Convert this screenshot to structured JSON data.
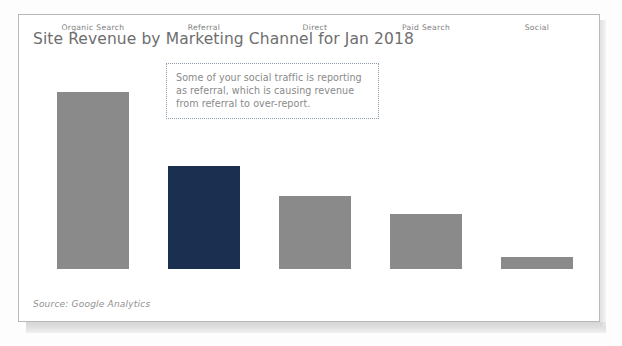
{
  "figure": {
    "title": "Site Revenue by Marketing Channel for Jan 2018",
    "source_note": "Source: Google Analytics",
    "annotation": "Some of your social traffic is reporting\nas referral, which is causing revenue\nfrom referral to over-report.",
    "colors": {
      "bar_default": "#8a8a8a",
      "bar_highlight": "#1b3050",
      "title_text": "#6e6e6e",
      "label_text": "#7d7d7d",
      "annotation_text": "#8a8a8a",
      "annotation_border": "#8d9aab",
      "frame_border": "#b9b9b9",
      "background": "#ffffff"
    }
  },
  "chart_data": {
    "type": "bar",
    "title": "Site Revenue by Marketing Channel for Jan 2018",
    "xlabel": "",
    "ylabel": "",
    "categories": [
      "Organic Search",
      "Referral",
      "Direct",
      "Paid Search",
      "Social"
    ],
    "values": [
      100,
      58,
      41,
      31,
      7
    ],
    "ylim": [
      0,
      100
    ],
    "grid": false,
    "legend": null,
    "bar_colors": [
      "#8a8a8a",
      "#1b3050",
      "#8a8a8a",
      "#8a8a8a",
      "#8a8a8a"
    ],
    "highlight_category": "Referral",
    "annotations": [
      {
        "text": "Some of your social traffic is reporting as referral, which is causing revenue from referral to over-report.",
        "style": "dotted-box"
      }
    ],
    "source": "Source: Google Analytics",
    "note": "Values are relative revenue indexed so the tallest bar (Organic Search) = 100; axis is unlabeled in the figure."
  }
}
